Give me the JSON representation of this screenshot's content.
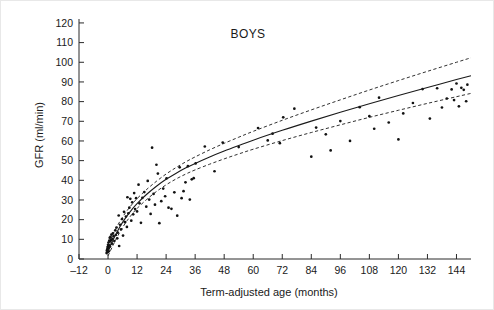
{
  "chart_data": {
    "type": "scatter",
    "title": "BOYS",
    "xlabel": "Term-adjusted age (months)",
    "ylabel": "GFR (ml/min)",
    "xlim": [
      -12,
      150
    ],
    "ylim": [
      0,
      122
    ],
    "grid": false,
    "legend": null,
    "xticks": [
      -12,
      0,
      12,
      24,
      36,
      48,
      60,
      72,
      84,
      96,
      108,
      120,
      132,
      144
    ],
    "xticklabels": [
      "–12",
      "0",
      "12",
      "24",
      "36",
      "48",
      "60",
      "72",
      "84",
      "96",
      "108",
      "120",
      "132",
      "144"
    ],
    "yticks": [
      0,
      10,
      20,
      30,
      40,
      50,
      60,
      70,
      80,
      90,
      100,
      110,
      120
    ],
    "yticklabels": [
      "0",
      "10",
      "20",
      "30",
      "40",
      "50",
      "60",
      "70",
      "80",
      "90",
      "100",
      "110",
      "120"
    ],
    "series": [
      {
        "name": "observations",
        "type": "scatter",
        "marker": "dot",
        "color": "#121212",
        "points": [
          [
            -0.6,
            3.0
          ],
          [
            -0.5,
            4.2
          ],
          [
            -0.3,
            5.0
          ],
          [
            -0.2,
            6.1
          ],
          [
            -0.1,
            3.6
          ],
          [
            0.0,
            4.6
          ],
          [
            0.0,
            7.2
          ],
          [
            0.1,
            5.4
          ],
          [
            0.2,
            6.6
          ],
          [
            0.2,
            8.4
          ],
          [
            0.3,
            3.9
          ],
          [
            0.4,
            5.8
          ],
          [
            0.5,
            9.3
          ],
          [
            0.6,
            7.0
          ],
          [
            0.7,
            10.8
          ],
          [
            0.8,
            6.3
          ],
          [
            0.9,
            8.9
          ],
          [
            1.0,
            11.2
          ],
          [
            1.2,
            9.6
          ],
          [
            1.4,
            12.4
          ],
          [
            1.6,
            7.8
          ],
          [
            1.8,
            10.2
          ],
          [
            2.0,
            13.0
          ],
          [
            2.3,
            11.6
          ],
          [
            2.6,
            9.1
          ],
          [
            3.0,
            14.6
          ],
          [
            3.2,
            12.2
          ],
          [
            3.5,
            16.0
          ],
          [
            3.8,
            10.5
          ],
          [
            4.0,
            13.4
          ],
          [
            4.4,
            22.1
          ],
          [
            4.6,
            6.6
          ],
          [
            5.0,
            17.4
          ],
          [
            5.4,
            15.1
          ],
          [
            5.8,
            20.3
          ],
          [
            6.2,
            11.9
          ],
          [
            6.6,
            24.0
          ],
          [
            7.0,
            18.7
          ],
          [
            7.4,
            21.6
          ],
          [
            7.8,
            16.3
          ],
          [
            8.0,
            31.4
          ],
          [
            8.4,
            23.2
          ],
          [
            8.8,
            26.1
          ],
          [
            9.2,
            30.6
          ],
          [
            9.6,
            19.5
          ],
          [
            10.0,
            28.8
          ],
          [
            10.4,
            22.7
          ],
          [
            10.8,
            33.5
          ],
          [
            11.2,
            25.4
          ],
          [
            11.6,
            30.9
          ],
          [
            12.0,
            24.2
          ],
          [
            12.6,
            37.8
          ],
          [
            13.0,
            28.3
          ],
          [
            13.6,
            18.4
          ],
          [
            14.2,
            31.1
          ],
          [
            15.0,
            34.0
          ],
          [
            15.8,
            26.6
          ],
          [
            16.4,
            39.7
          ],
          [
            17.0,
            30.2
          ],
          [
            17.6,
            22.9
          ],
          [
            18.2,
            56.6
          ],
          [
            18.8,
            33.1
          ],
          [
            19.4,
            27.6
          ],
          [
            20.0,
            47.9
          ],
          [
            20.6,
            43.4
          ],
          [
            21.2,
            18.2
          ],
          [
            22.0,
            29.4
          ],
          [
            22.8,
            35.8
          ],
          [
            23.6,
            31.9
          ],
          [
            24.2,
            41.0
          ],
          [
            25.0,
            26.1
          ],
          [
            26.2,
            25.5
          ],
          [
            27.4,
            33.9
          ],
          [
            28.6,
            22.0
          ],
          [
            29.6,
            46.6
          ],
          [
            30.4,
            30.9
          ],
          [
            31.2,
            34.5
          ],
          [
            32.0,
            39.0
          ],
          [
            33.0,
            47.2
          ],
          [
            33.8,
            30.2
          ],
          [
            34.6,
            40.5
          ],
          [
            35.4,
            41.1
          ],
          [
            36.2,
            48.6
          ],
          [
            40.0,
            57.2
          ],
          [
            44.0,
            44.6
          ],
          [
            47.4,
            59.2
          ],
          [
            54.0,
            56.9
          ],
          [
            62.0,
            66.6
          ],
          [
            66.0,
            60.3
          ],
          [
            68.0,
            63.7
          ],
          [
            71.0,
            58.9
          ],
          [
            72.4,
            72.0
          ],
          [
            77.0,
            76.4
          ],
          [
            84.0,
            52.0
          ],
          [
            86.0,
            66.8
          ],
          [
            90.0,
            63.4
          ],
          [
            92.0,
            55.2
          ],
          [
            96.0,
            70.1
          ],
          [
            100.0,
            60.0
          ],
          [
            104.0,
            77.2
          ],
          [
            108.0,
            72.6
          ],
          [
            110.0,
            66.2
          ],
          [
            112.0,
            82.0
          ],
          [
            116.0,
            69.4
          ],
          [
            120.0,
            60.8
          ],
          [
            122.0,
            74.0
          ],
          [
            126.0,
            79.3
          ],
          [
            130.0,
            86.4
          ],
          [
            133.0,
            71.4
          ],
          [
            136.0,
            86.8
          ],
          [
            138.0,
            77.0
          ],
          [
            140.0,
            81.6
          ],
          [
            142.0,
            86.2
          ],
          [
            143.0,
            80.8
          ],
          [
            144.0,
            89.2
          ],
          [
            145.0,
            77.6
          ],
          [
            146.0,
            87.0
          ],
          [
            147.0,
            86.0
          ],
          [
            148.0,
            80.2
          ],
          [
            148.5,
            88.6
          ]
        ]
      },
      {
        "name": "fitted-curve",
        "type": "line",
        "style": "solid",
        "color": "#1a1a1a",
        "points": [
          [
            0,
            4.0
          ],
          [
            2,
            9.5
          ],
          [
            4,
            14.4
          ],
          [
            6,
            18.6
          ],
          [
            8,
            22.2
          ],
          [
            10,
            25.4
          ],
          [
            12,
            28.2
          ],
          [
            16,
            32.9
          ],
          [
            20,
            37.0
          ],
          [
            24,
            40.5
          ],
          [
            28,
            43.5
          ],
          [
            32,
            46.2
          ],
          [
            36,
            48.6
          ],
          [
            42,
            51.9
          ],
          [
            48,
            54.9
          ],
          [
            54,
            57.7
          ],
          [
            60,
            60.4
          ],
          [
            72,
            65.4
          ],
          [
            84,
            70.1
          ],
          [
            96,
            74.6
          ],
          [
            108,
            78.9
          ],
          [
            120,
            83.1
          ],
          [
            132,
            87.2
          ],
          [
            144,
            91.2
          ],
          [
            150,
            93.2
          ]
        ]
      },
      {
        "name": "upper-confidence-band",
        "type": "line",
        "style": "dashed",
        "color": "#1a1a1a",
        "points": [
          [
            0,
            7.2
          ],
          [
            2,
            12.5
          ],
          [
            4,
            17.2
          ],
          [
            6,
            21.3
          ],
          [
            8,
            24.8
          ],
          [
            10,
            27.9
          ],
          [
            12,
            30.7
          ],
          [
            16,
            35.4
          ],
          [
            20,
            39.5
          ],
          [
            24,
            43.2
          ],
          [
            28,
            46.4
          ],
          [
            32,
            49.3
          ],
          [
            36,
            51.9
          ],
          [
            42,
            55.5
          ],
          [
            48,
            58.8
          ],
          [
            54,
            61.9
          ],
          [
            60,
            64.9
          ],
          [
            72,
            70.5
          ],
          [
            84,
            75.8
          ],
          [
            96,
            80.9
          ],
          [
            108,
            85.9
          ],
          [
            120,
            90.7
          ],
          [
            132,
            95.4
          ],
          [
            144,
            100.0
          ],
          [
            150,
            102.3
          ]
        ]
      },
      {
        "name": "lower-confidence-band",
        "type": "line",
        "style": "dashed",
        "color": "#1a1a1a",
        "points": [
          [
            0,
            1.6
          ],
          [
            2,
            6.8
          ],
          [
            4,
            11.7
          ],
          [
            6,
            16.0
          ],
          [
            8,
            19.7
          ],
          [
            10,
            22.9
          ],
          [
            12,
            25.7
          ],
          [
            16,
            30.3
          ],
          [
            20,
            34.3
          ],
          [
            24,
            37.7
          ],
          [
            28,
            40.6
          ],
          [
            32,
            43.1
          ],
          [
            36,
            45.3
          ],
          [
            42,
            48.2
          ],
          [
            48,
            50.9
          ],
          [
            54,
            53.4
          ],
          [
            60,
            55.8
          ],
          [
            72,
            60.2
          ],
          [
            84,
            64.3
          ],
          [
            96,
            68.2
          ],
          [
            108,
            72.0
          ],
          [
            120,
            75.6
          ],
          [
            132,
            79.1
          ],
          [
            144,
            82.5
          ],
          [
            150,
            84.2
          ]
        ]
      }
    ]
  }
}
